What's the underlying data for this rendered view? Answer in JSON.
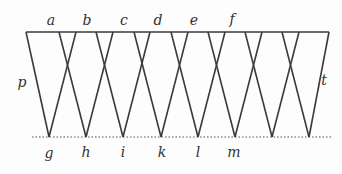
{
  "diagram": {
    "type": "zigzag-lattice",
    "colors": {
      "line": "#3a3a3a",
      "dotted": "#555555",
      "background": "#fdfdfd"
    },
    "top_line": {
      "x1": 26,
      "x2": 329,
      "y": 32
    },
    "baseline": {
      "x1": 32,
      "x2": 332,
      "y": 137,
      "style": "dotted"
    },
    "left_edge": {
      "x1": 26,
      "y1": 32,
      "x2": 49,
      "y2": 137
    },
    "right_edge": {
      "x1": 329,
      "y1": 32,
      "x2": 309,
      "y2": 137
    },
    "bottom_points": [
      49,
      86,
      123,
      161,
      198,
      235,
      272,
      309
    ],
    "arm_offset": 27,
    "top_labels": [
      {
        "text": "a",
        "x": 51,
        "y": 20
      },
      {
        "text": "b",
        "x": 87,
        "y": 20
      },
      {
        "text": "c",
        "x": 124,
        "y": 20
      },
      {
        "text": "d",
        "x": 158,
        "y": 20
      },
      {
        "text": "e",
        "x": 194,
        "y": 20
      },
      {
        "text": "f",
        "x": 232,
        "y": 19
      }
    ],
    "bottom_labels": [
      {
        "text": "g",
        "x": 49,
        "y": 153
      },
      {
        "text": "h",
        "x": 86,
        "y": 152
      },
      {
        "text": "i",
        "x": 123,
        "y": 152
      },
      {
        "text": "k",
        "x": 162,
        "y": 152
      },
      {
        "text": "l",
        "x": 198,
        "y": 152
      },
      {
        "text": "m",
        "x": 234,
        "y": 152
      }
    ],
    "side_labels": [
      {
        "text": "p",
        "x": 22,
        "y": 82
      },
      {
        "text": "t",
        "x": 324,
        "y": 80
      }
    ]
  }
}
